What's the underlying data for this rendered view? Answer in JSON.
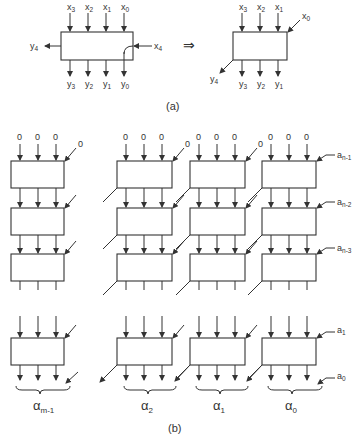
{
  "part_a": {
    "caption": "(a)",
    "left_block": {
      "inputs_top": [
        {
          "base": "x",
          "sub": "3"
        },
        {
          "base": "x",
          "sub": "2"
        },
        {
          "base": "x",
          "sub": "1"
        },
        {
          "base": "x",
          "sub": "0"
        }
      ],
      "outputs_bottom": [
        {
          "base": "y",
          "sub": "3"
        },
        {
          "base": "y",
          "sub": "2"
        },
        {
          "base": "y",
          "sub": "1"
        },
        {
          "base": "y",
          "sub": "0"
        }
      ],
      "input_right": {
        "base": "x",
        "sub": "4"
      },
      "output_left": {
        "base": "y",
        "sub": "4"
      }
    },
    "transform_arrow": "⇒",
    "right_block": {
      "inputs_top": [
        {
          "base": "x",
          "sub": "3"
        },
        {
          "base": "x",
          "sub": "2"
        },
        {
          "base": "x",
          "sub": "1"
        }
      ],
      "input_corner": {
        "base": "x",
        "sub": "0"
      },
      "outputs_bottom": [
        {
          "base": "y",
          "sub": "3"
        },
        {
          "base": "y",
          "sub": "2"
        },
        {
          "base": "y",
          "sub": "1"
        }
      ],
      "output_corner": {
        "base": "y",
        "sub": "4"
      }
    }
  },
  "part_b": {
    "caption": "(b)",
    "top_inputs": "0",
    "corner_inputs": [
      "0",
      "0"
    ],
    "row_inputs": [
      {
        "base": "a",
        "sub": "n-1"
      },
      {
        "base": "a",
        "sub": "n-2"
      },
      {
        "base": "a",
        "sub": "n-3"
      },
      {
        "base": "a",
        "sub": "1"
      },
      {
        "base": "a",
        "sub": "0"
      }
    ],
    "groups": [
      {
        "base": "α",
        "sub": "m-1"
      },
      {
        "base": "α",
        "sub": "2"
      },
      {
        "base": "α",
        "sub": "1"
      },
      {
        "base": "α",
        "sub": "0"
      }
    ]
  }
}
